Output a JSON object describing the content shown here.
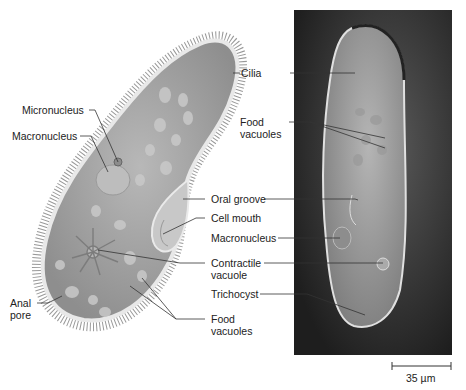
{
  "figure": {
    "illustration_labels": {
      "micronucleus": "Micronucleus",
      "macronucleus": "Macronucleus",
      "anal_pore_line1": "Anal",
      "anal_pore_line2": "pore"
    },
    "shared_labels": {
      "cilia": "Cilia",
      "food_vacuoles_top_1": "Food",
      "food_vacuoles_top_2": "vacuoles",
      "oral_groove": "Oral groove",
      "cell_mouth": "Cell mouth",
      "macronucleus": "Macronucleus",
      "contractile_1": "Contractile",
      "contractile_2": "vacuole",
      "trichocyst": "Trichocyst",
      "food_vacuoles_bottom_1": "Food",
      "food_vacuoles_bottom_2": "vacuoles"
    },
    "scale_bar": {
      "label": "35 µm"
    },
    "colors": {
      "cell_body": "#a9a9a9",
      "cell_rim": "#e6e6e6",
      "photo_bg": "#3a3a3a",
      "leader_line": "#333333"
    }
  }
}
